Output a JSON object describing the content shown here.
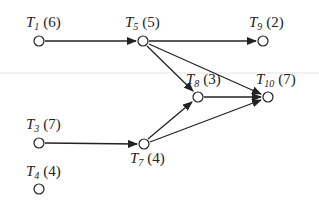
{
  "diagram": {
    "type": "task-graph",
    "nodes": [
      {
        "id": "T1",
        "letter": "T",
        "sub": "1",
        "weight": "(6)",
        "x": 39,
        "y": 41
      },
      {
        "id": "T5",
        "letter": "T",
        "sub": "5",
        "weight": "(5)",
        "x": 143,
        "y": 41
      },
      {
        "id": "T9",
        "letter": "T",
        "sub": "9",
        "weight": "(2)",
        "x": 263,
        "y": 41
      },
      {
        "id": "T8",
        "letter": "T",
        "sub": "8",
        "weight": "(3)",
        "x": 198,
        "y": 97
      },
      {
        "id": "T10",
        "letter": "T",
        "sub": "10",
        "weight": "(7)",
        "x": 268,
        "y": 97
      },
      {
        "id": "T3",
        "letter": "T",
        "sub": "3",
        "weight": "(7)",
        "x": 39,
        "y": 143
      },
      {
        "id": "T7",
        "letter": "T",
        "sub": "7",
        "weight": "(4)",
        "x": 144,
        "y": 144
      },
      {
        "id": "T4",
        "letter": "T",
        "sub": "4",
        "weight": "(4)",
        "x": 39,
        "y": 189
      }
    ],
    "edges": [
      {
        "from": "T1",
        "to": "T5"
      },
      {
        "from": "T5",
        "to": "T9"
      },
      {
        "from": "T5",
        "to": "T8"
      },
      {
        "from": "T5",
        "to": "T10"
      },
      {
        "from": "T8",
        "to": "T10"
      },
      {
        "from": "T3",
        "to": "T7"
      },
      {
        "from": "T7",
        "to": "T8"
      },
      {
        "from": "T7",
        "to": "T10"
      }
    ]
  },
  "labels": {
    "T1": {
      "letter": "T",
      "sub": "1",
      "weight": "(6)"
    },
    "T5": {
      "letter": "T",
      "sub": "5",
      "weight": "(5)"
    },
    "T9": {
      "letter": "T",
      "sub": "9",
      "weight": "(2)"
    },
    "T8": {
      "letter": "T",
      "sub": "8",
      "weight": "(3)"
    },
    "T10": {
      "letter": "T",
      "sub": "10",
      "weight": "(7)"
    },
    "T3": {
      "letter": "T",
      "sub": "3",
      "weight": "(7)"
    },
    "T7": {
      "letter": "T",
      "sub": "7",
      "weight": "(4)"
    },
    "T4": {
      "letter": "T",
      "sub": "4",
      "weight": "(4)"
    }
  }
}
